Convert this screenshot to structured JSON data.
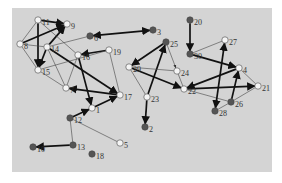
{
  "diagram": {
    "type": "directed-graph",
    "background": "#d4d4d4",
    "colors": {
      "filled": "#555555",
      "hollow": "#f4f4f4",
      "strong_edge": "#111111",
      "weak_edge": "#444444"
    },
    "nodes": [
      {
        "id": "1",
        "x": 92,
        "y": 108,
        "fill": "hollow"
      },
      {
        "id": "2",
        "x": 145,
        "y": 127,
        "fill": "filled"
      },
      {
        "id": "3",
        "x": 153,
        "y": 30,
        "fill": "filled"
      },
      {
        "id": "4",
        "x": 239,
        "y": 68,
        "fill": "hollow"
      },
      {
        "id": "5",
        "x": 120,
        "y": 143,
        "fill": "hollow"
      },
      {
        "id": "6",
        "x": 90,
        "y": 36,
        "fill": "filled"
      },
      {
        "id": "7",
        "x": 66,
        "y": 88,
        "fill": "hollow"
      },
      {
        "id": "8",
        "x": 20,
        "y": 44,
        "fill": "hollow"
      },
      {
        "id": "9",
        "x": 67,
        "y": 24,
        "fill": "hollow"
      },
      {
        "id": "10",
        "x": 33,
        "y": 147,
        "fill": "filled"
      },
      {
        "id": "11",
        "x": 38,
        "y": 20,
        "fill": "hollow"
      },
      {
        "id": "12",
        "x": 70,
        "y": 118,
        "fill": "filled"
      },
      {
        "id": "13",
        "x": 73,
        "y": 145,
        "fill": "filled"
      },
      {
        "id": "14",
        "x": 47,
        "y": 47,
        "fill": "hollow"
      },
      {
        "id": "15",
        "x": 38,
        "y": 70,
        "fill": "hollow"
      },
      {
        "id": "16",
        "x": 78,
        "y": 55,
        "fill": "hollow"
      },
      {
        "id": "17",
        "x": 120,
        "y": 95,
        "fill": "hollow"
      },
      {
        "id": "18",
        "x": 92,
        "y": 154,
        "fill": "filled"
      },
      {
        "id": "19",
        "x": 109,
        "y": 50,
        "fill": "hollow"
      },
      {
        "id": "20",
        "x": 190,
        "y": 20,
        "fill": "filled"
      },
      {
        "id": "21",
        "x": 258,
        "y": 86,
        "fill": "hollow"
      },
      {
        "id": "22",
        "x": 184,
        "y": 89,
        "fill": "hollow"
      },
      {
        "id": "23",
        "x": 147,
        "y": 97,
        "fill": "hollow"
      },
      {
        "id": "24",
        "x": 177,
        "y": 71,
        "fill": "hollow"
      },
      {
        "id": "25",
        "x": 166,
        "y": 42,
        "fill": "filled"
      },
      {
        "id": "26",
        "x": 231,
        "y": 102,
        "fill": "filled"
      },
      {
        "id": "27",
        "x": 225,
        "y": 40,
        "fill": "hollow"
      },
      {
        "id": "28",
        "x": 215,
        "y": 111,
        "fill": "filled"
      },
      {
        "id": "29",
        "x": 129,
        "y": 67,
        "fill": "hollow"
      },
      {
        "id": "30",
        "x": 190,
        "y": 54,
        "fill": "filled"
      }
    ],
    "edges": [
      {
        "from": "11",
        "to": "9",
        "weight": "strong",
        "arrow": "end"
      },
      {
        "from": "8",
        "to": "9",
        "weight": "strong",
        "arrow": "end"
      },
      {
        "from": "11",
        "to": "15",
        "weight": "strong",
        "arrow": "end"
      },
      {
        "from": "14",
        "to": "9",
        "weight": "strong",
        "arrow": "end"
      },
      {
        "from": "14",
        "to": "15",
        "weight": "strong",
        "arrow": "end"
      },
      {
        "from": "11",
        "to": "8",
        "weight": "weak",
        "arrow": "none"
      },
      {
        "from": "8",
        "to": "15",
        "weight": "weak",
        "arrow": "none"
      },
      {
        "from": "8",
        "to": "14",
        "weight": "weak",
        "arrow": "none"
      },
      {
        "from": "11",
        "to": "16",
        "weight": "weak",
        "arrow": "none"
      },
      {
        "from": "14",
        "to": "6",
        "weight": "weak",
        "arrow": "none"
      },
      {
        "from": "3",
        "to": "6",
        "weight": "strong",
        "arrow": "both"
      },
      {
        "from": "19",
        "to": "16",
        "weight": "strong",
        "arrow": "end"
      },
      {
        "from": "16",
        "to": "1",
        "weight": "strong",
        "arrow": "end"
      },
      {
        "from": "14",
        "to": "17",
        "weight": "strong",
        "arrow": "end"
      },
      {
        "from": "17",
        "to": "7",
        "weight": "strong",
        "arrow": "end"
      },
      {
        "from": "14",
        "to": "7",
        "weight": "weak",
        "arrow": "none"
      },
      {
        "from": "15",
        "to": "7",
        "weight": "weak",
        "arrow": "none"
      },
      {
        "from": "15",
        "to": "19",
        "weight": "weak",
        "arrow": "none"
      },
      {
        "from": "16",
        "to": "7",
        "weight": "weak",
        "arrow": "none"
      },
      {
        "from": "19",
        "to": "17",
        "weight": "weak",
        "arrow": "none"
      },
      {
        "from": "12",
        "to": "1",
        "weight": "strong",
        "arrow": "end"
      },
      {
        "from": "1",
        "to": "17",
        "weight": "strong",
        "arrow": "end"
      },
      {
        "from": "12",
        "to": "13",
        "weight": "weak",
        "arrow": "none"
      },
      {
        "from": "12",
        "to": "5",
        "weight": "weak",
        "arrow": "none"
      },
      {
        "from": "13",
        "to": "10",
        "weight": "strong",
        "arrow": "end"
      },
      {
        "from": "20",
        "to": "30",
        "weight": "strong",
        "arrow": "end"
      },
      {
        "from": "30",
        "to": "27",
        "weight": "weak",
        "arrow": "none"
      },
      {
        "from": "30",
        "to": "4",
        "weight": "strong",
        "arrow": "end"
      },
      {
        "from": "25",
        "to": "29",
        "weight": "strong",
        "arrow": "end"
      },
      {
        "from": "23",
        "to": "25",
        "weight": "strong",
        "arrow": "end"
      },
      {
        "from": "25",
        "to": "24",
        "weight": "weak",
        "arrow": "end"
      },
      {
        "from": "29",
        "to": "24",
        "weight": "weak",
        "arrow": "none"
      },
      {
        "from": "29",
        "to": "23",
        "weight": "weak",
        "arrow": "none"
      },
      {
        "from": "29",
        "to": "22",
        "weight": "strong",
        "arrow": "end"
      },
      {
        "from": "23",
        "to": "2",
        "weight": "strong",
        "arrow": "end"
      },
      {
        "from": "4",
        "to": "22",
        "weight": "strong",
        "arrow": "end"
      },
      {
        "from": "22",
        "to": "21",
        "weight": "strong",
        "arrow": "end"
      },
      {
        "from": "22",
        "to": "26",
        "weight": "weak",
        "arrow": "none"
      },
      {
        "from": "4",
        "to": "21",
        "weight": "weak",
        "arrow": "none"
      },
      {
        "from": "26",
        "to": "21",
        "weight": "weak",
        "arrow": "none"
      },
      {
        "from": "26",
        "to": "4",
        "weight": "strong",
        "arrow": "end"
      },
      {
        "from": "28",
        "to": "27",
        "weight": "strong",
        "arrow": "both"
      },
      {
        "from": "28",
        "to": "26",
        "weight": "weak",
        "arrow": "none"
      },
      {
        "from": "24",
        "to": "22",
        "weight": "weak",
        "arrow": "none"
      }
    ]
  }
}
